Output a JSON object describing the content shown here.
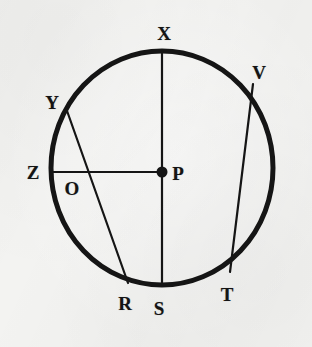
{
  "figure": {
    "background_color": "#f3f3f1",
    "ink_color": "#151515",
    "circle": {
      "center_label": "P",
      "center_x": 162,
      "center_y": 168,
      "radius_x": 111,
      "radius_y": 117,
      "stroke_width": 5
    },
    "center_dot": {
      "x": 162,
      "y": 172,
      "radius": 5.5
    },
    "segments": [
      {
        "name": "diameter-xs",
        "from_label": "X",
        "to_label": "S",
        "x1": 162,
        "y1": 52,
        "x2": 162,
        "y2": 285,
        "stroke_width": 2.2
      },
      {
        "name": "radius-zp",
        "from_label": "Z",
        "to_label": "P",
        "x1": 51,
        "y1": 172,
        "x2": 162,
        "y2": 172,
        "stroke_width": 2.2
      },
      {
        "name": "chord-yr",
        "from_label": "Y",
        "to_label": "R",
        "x1": 66,
        "y1": 108,
        "x2": 128,
        "y2": 283,
        "stroke_width": 2.2
      },
      {
        "name": "chord-vt",
        "from_label": "V",
        "to_label": "T",
        "x1": 253,
        "y1": 84,
        "x2": 230,
        "y2": 272,
        "stroke_width": 2.2
      }
    ],
    "labels": [
      {
        "id": "x",
        "text": "X",
        "x": 164,
        "y": 33
      },
      {
        "id": "v",
        "text": "V",
        "x": 259,
        "y": 72
      },
      {
        "id": "y",
        "text": "Y",
        "x": 52,
        "y": 102
      },
      {
        "id": "z",
        "text": "Z",
        "x": 33,
        "y": 172
      },
      {
        "id": "p",
        "text": "P",
        "x": 178,
        "y": 173
      },
      {
        "id": "o",
        "text": "O",
        "x": 72,
        "y": 188
      },
      {
        "id": "r",
        "text": "R",
        "x": 125,
        "y": 303
      },
      {
        "id": "s",
        "text": "S",
        "x": 159,
        "y": 308
      },
      {
        "id": "t",
        "text": "T",
        "x": 227,
        "y": 294
      }
    ]
  }
}
